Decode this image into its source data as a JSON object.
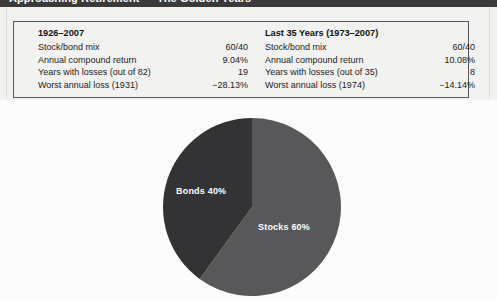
{
  "header": {
    "title": "Approaching Retirement — The Golden Years"
  },
  "panels": [
    {
      "title": "1926–2007",
      "rows": [
        {
          "label": "Stock/bond mix",
          "value": "60/40"
        },
        {
          "label": "Annual compound return",
          "value": "9.04%"
        },
        {
          "label": "Years with losses (out of 82)",
          "value": "19"
        },
        {
          "label": "Worst annual loss (1931)",
          "value": "−28.13%"
        }
      ]
    },
    {
      "title": "Last 35 Years (1973–2007)",
      "rows": [
        {
          "label": "Stock/bond mix",
          "value": "60/40"
        },
        {
          "label": "Annual compound return",
          "value": "10.08%"
        },
        {
          "label": "Years with losses (out of 35)",
          "value": "8"
        },
        {
          "label": "Worst annual loss (1974)",
          "value": "−14.14%"
        }
      ]
    }
  ],
  "chart_data": {
    "type": "pie",
    "title": "",
    "categories": [
      "Stocks",
      "Bonds"
    ],
    "values": [
      60,
      40
    ],
    "labels": [
      "Stocks 60%",
      "Bonds 40%"
    ],
    "colors": [
      "#58585a",
      "#333335"
    ],
    "start_angle_deg": 0,
    "direction": "clockwise",
    "legend": "none",
    "data_labels": true
  }
}
